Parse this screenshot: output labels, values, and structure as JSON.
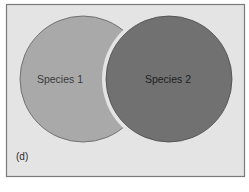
{
  "figure": {
    "panel_label": "(d)",
    "species": [
      {
        "label": "Species 1",
        "color": "#a9a9a9"
      },
      {
        "label": "Species 2",
        "color": "#717171"
      }
    ],
    "background": "#e4e4e4",
    "frame_color": "#7a7a7a"
  }
}
